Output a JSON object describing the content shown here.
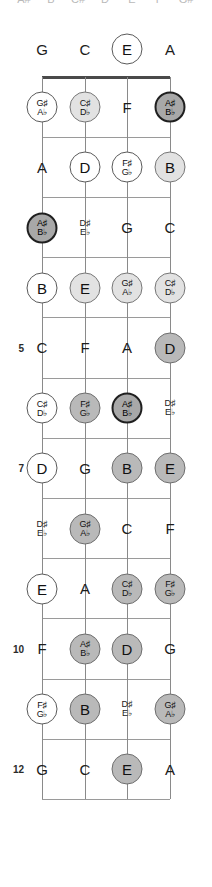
{
  "diagram": {
    "type": "fretboard",
    "instrument_tuning": [
      "G",
      "C",
      "E",
      "A"
    ],
    "num_strings": 4,
    "num_frets": 12,
    "marked_fret_numbers": [
      "5",
      "7",
      "10",
      "12"
    ],
    "colors": {
      "nut": "#4a4a4a",
      "fret": "#9a9a9a",
      "string": "#8a8a8a",
      "fill_white": "#ffffff",
      "fill_light": "#e2e2e2",
      "fill_mid": "#b9b9b9",
      "fill_dark": "#a8a8a8",
      "text": "#1c1c1c"
    }
  },
  "clipped_header": {
    "items": [
      "A#",
      "B",
      "C#",
      "D",
      "E",
      "F",
      "G#"
    ]
  },
  "fret_numbers": [
    {
      "label": "5",
      "fret": 5
    },
    {
      "label": "7",
      "fret": 7
    },
    {
      "label": "10",
      "fret": 10
    },
    {
      "label": "12",
      "fret": 12
    }
  ],
  "notes": [
    {
      "fret": 0,
      "string": 0,
      "natural": "G",
      "sharp": "",
      "flat": "",
      "style": "plain"
    },
    {
      "fret": 0,
      "string": 1,
      "natural": "C",
      "sharp": "",
      "flat": "",
      "style": "plain"
    },
    {
      "fret": 0,
      "string": 2,
      "natural": "E",
      "sharp": "",
      "flat": "",
      "style": "white"
    },
    {
      "fret": 0,
      "string": 3,
      "natural": "A",
      "sharp": "",
      "flat": "",
      "style": "plain"
    },
    {
      "fret": 1,
      "string": 0,
      "natural": "",
      "sharp": "G♯",
      "flat": "A♭",
      "style": "white"
    },
    {
      "fret": 1,
      "string": 1,
      "natural": "",
      "sharp": "C♯",
      "flat": "D♭",
      "style": "light"
    },
    {
      "fret": 1,
      "string": 2,
      "natural": "F",
      "sharp": "",
      "flat": "",
      "style": "plain"
    },
    {
      "fret": 1,
      "string": 3,
      "natural": "",
      "sharp": "A♯",
      "flat": "B♭",
      "style": "dark"
    },
    {
      "fret": 2,
      "string": 0,
      "natural": "A",
      "sharp": "",
      "flat": "",
      "style": "plain"
    },
    {
      "fret": 2,
      "string": 1,
      "natural": "D",
      "sharp": "",
      "flat": "",
      "style": "white"
    },
    {
      "fret": 2,
      "string": 2,
      "natural": "",
      "sharp": "F♯",
      "flat": "G♭",
      "style": "white"
    },
    {
      "fret": 2,
      "string": 3,
      "natural": "B",
      "sharp": "",
      "flat": "",
      "style": "light"
    },
    {
      "fret": 3,
      "string": 0,
      "natural": "",
      "sharp": "A♯",
      "flat": "B♭",
      "style": "dark"
    },
    {
      "fret": 3,
      "string": 1,
      "natural": "",
      "sharp": "D♯",
      "flat": "E♭",
      "style": "plain"
    },
    {
      "fret": 3,
      "string": 2,
      "natural": "G",
      "sharp": "",
      "flat": "",
      "style": "plain"
    },
    {
      "fret": 3,
      "string": 3,
      "natural": "C",
      "sharp": "",
      "flat": "",
      "style": "plain"
    },
    {
      "fret": 4,
      "string": 0,
      "natural": "B",
      "sharp": "",
      "flat": "",
      "style": "white"
    },
    {
      "fret": 4,
      "string": 1,
      "natural": "E",
      "sharp": "",
      "flat": "",
      "style": "light"
    },
    {
      "fret": 4,
      "string": 2,
      "natural": "",
      "sharp": "G♯",
      "flat": "A♭",
      "style": "light"
    },
    {
      "fret": 4,
      "string": 3,
      "natural": "",
      "sharp": "C♯",
      "flat": "D♭",
      "style": "light"
    },
    {
      "fret": 5,
      "string": 0,
      "natural": "C",
      "sharp": "",
      "flat": "",
      "style": "plain"
    },
    {
      "fret": 5,
      "string": 1,
      "natural": "F",
      "sharp": "",
      "flat": "",
      "style": "plain"
    },
    {
      "fret": 5,
      "string": 2,
      "natural": "A",
      "sharp": "",
      "flat": "",
      "style": "plain"
    },
    {
      "fret": 5,
      "string": 3,
      "natural": "D",
      "sharp": "",
      "flat": "",
      "style": "mid"
    },
    {
      "fret": 6,
      "string": 0,
      "natural": "",
      "sharp": "C♯",
      "flat": "D♭",
      "style": "white"
    },
    {
      "fret": 6,
      "string": 1,
      "natural": "",
      "sharp": "F♯",
      "flat": "G♭",
      "style": "mid"
    },
    {
      "fret": 6,
      "string": 2,
      "natural": "",
      "sharp": "A♯",
      "flat": "B♭",
      "style": "dark"
    },
    {
      "fret": 6,
      "string": 3,
      "natural": "",
      "sharp": "D♯",
      "flat": "E♭",
      "style": "plain"
    },
    {
      "fret": 7,
      "string": 0,
      "natural": "D",
      "sharp": "",
      "flat": "",
      "style": "white"
    },
    {
      "fret": 7,
      "string": 1,
      "natural": "G",
      "sharp": "",
      "flat": "",
      "style": "plain"
    },
    {
      "fret": 7,
      "string": 2,
      "natural": "B",
      "sharp": "",
      "flat": "",
      "style": "mid"
    },
    {
      "fret": 7,
      "string": 3,
      "natural": "E",
      "sharp": "",
      "flat": "",
      "style": "mid"
    },
    {
      "fret": 8,
      "string": 0,
      "natural": "",
      "sharp": "D♯",
      "flat": "E♭",
      "style": "plain"
    },
    {
      "fret": 8,
      "string": 1,
      "natural": "",
      "sharp": "G♯",
      "flat": "A♭",
      "style": "mid"
    },
    {
      "fret": 8,
      "string": 2,
      "natural": "C",
      "sharp": "",
      "flat": "",
      "style": "plain"
    },
    {
      "fret": 8,
      "string": 3,
      "natural": "F",
      "sharp": "",
      "flat": "",
      "style": "plain"
    },
    {
      "fret": 9,
      "string": 0,
      "natural": "E",
      "sharp": "",
      "flat": "",
      "style": "white"
    },
    {
      "fret": 9,
      "string": 1,
      "natural": "A",
      "sharp": "",
      "flat": "",
      "style": "plain"
    },
    {
      "fret": 9,
      "string": 2,
      "natural": "",
      "sharp": "C♯",
      "flat": "D♭",
      "style": "mid"
    },
    {
      "fret": 9,
      "string": 3,
      "natural": "",
      "sharp": "F♯",
      "flat": "G♭",
      "style": "mid"
    },
    {
      "fret": 10,
      "string": 0,
      "natural": "F",
      "sharp": "",
      "flat": "",
      "style": "plain"
    },
    {
      "fret": 10,
      "string": 1,
      "natural": "",
      "sharp": "A♯",
      "flat": "B♭",
      "style": "mid"
    },
    {
      "fret": 10,
      "string": 2,
      "natural": "D",
      "sharp": "",
      "flat": "",
      "style": "mid"
    },
    {
      "fret": 10,
      "string": 3,
      "natural": "G",
      "sharp": "",
      "flat": "",
      "style": "plain"
    },
    {
      "fret": 11,
      "string": 0,
      "natural": "",
      "sharp": "F♯",
      "flat": "G♭",
      "style": "white"
    },
    {
      "fret": 11,
      "string": 1,
      "natural": "B",
      "sharp": "",
      "flat": "",
      "style": "mid"
    },
    {
      "fret": 11,
      "string": 2,
      "natural": "",
      "sharp": "D♯",
      "flat": "E♭",
      "style": "plain"
    },
    {
      "fret": 11,
      "string": 3,
      "natural": "",
      "sharp": "G♯",
      "flat": "A♭",
      "style": "mid"
    },
    {
      "fret": 12,
      "string": 0,
      "natural": "G",
      "sharp": "",
      "flat": "",
      "style": "plain"
    },
    {
      "fret": 12,
      "string": 1,
      "natural": "C",
      "sharp": "",
      "flat": "",
      "style": "plain"
    },
    {
      "fret": 12,
      "string": 2,
      "natural": "E",
      "sharp": "",
      "flat": "",
      "style": "mid"
    },
    {
      "fret": 12,
      "string": 3,
      "natural": "A",
      "sharp": "",
      "flat": "",
      "style": "plain"
    }
  ]
}
